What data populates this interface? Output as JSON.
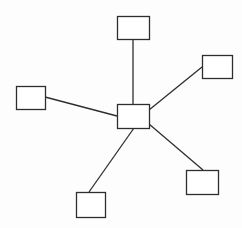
{
  "diagram": {
    "type": "star-topology",
    "background": "#fdfdfd",
    "stroke_color": "#2e2e2e",
    "stroke_width": 1.3,
    "box_fill": "#ffffff",
    "hub": {
      "id": "hub",
      "x": 117,
      "y": 104,
      "w": 32,
      "h": 24
    },
    "nodes": [
      {
        "id": "node-top",
        "x": 117,
        "y": 16,
        "w": 32,
        "h": 23
      },
      {
        "id": "node-top-right",
        "x": 202,
        "y": 55,
        "w": 30,
        "h": 23
      },
      {
        "id": "node-left",
        "x": 16,
        "y": 86,
        "w": 29,
        "h": 23
      },
      {
        "id": "node-bottom-right",
        "x": 186,
        "y": 170,
        "w": 32,
        "h": 24
      },
      {
        "id": "node-bottom-left",
        "x": 76,
        "y": 192,
        "w": 29,
        "h": 25
      }
    ],
    "edges": [
      {
        "from": "hub",
        "to": "node-top",
        "x1": 133,
        "y1": 104,
        "x2": 133,
        "y2": 39
      },
      {
        "from": "hub",
        "to": "node-top-right",
        "x1": 149,
        "y1": 110,
        "x2": 202,
        "y2": 67
      },
      {
        "from": "hub",
        "to": "node-left",
        "x1": 117,
        "y1": 116,
        "x2": 45,
        "y2": 97
      },
      {
        "from": "hub",
        "to": "node-bottom-right",
        "x1": 149,
        "y1": 124,
        "x2": 203,
        "y2": 170
      },
      {
        "from": "hub",
        "to": "node-bottom-left",
        "x1": 134,
        "y1": 128,
        "x2": 89,
        "y2": 192
      }
    ]
  }
}
